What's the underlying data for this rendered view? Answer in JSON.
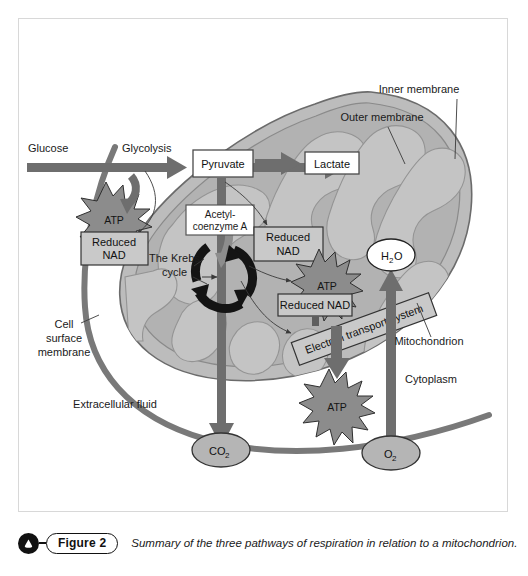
{
  "figure": {
    "number_label": "Figure 2",
    "caption": "Summary of the three pathways of respiration in relation to a mitochondrion.",
    "badge_icon": "triangle-in-circle-icon"
  },
  "diagram": {
    "title": "Summary of the three pathways of respiration in relation to a mitochondrion",
    "pathway_labels": {
      "glucose": "Glucose",
      "glycolysis": "Glycolysis",
      "pyruvate": "Pyruvate",
      "lactate": "Lactate",
      "acetyl_coenzyme_a_line1": "Acetyl-",
      "acetyl_coenzyme_a_line2": "coenzyme A",
      "krebs_line1": "The Krebs",
      "krebs_line2": "cycle",
      "electron_transport_system": "Electron transport system"
    },
    "products": {
      "atp_glycolysis": "ATP",
      "atp_krebs": "ATP",
      "atp_ets": "ATP",
      "reduced_nad_glycolysis_line1": "Reduced",
      "reduced_nad_glycolysis_line2": "NAD",
      "reduced_nad_link_line1": "Reduced",
      "reduced_nad_link_line2": "NAD",
      "reduced_nad_krebs": "Reduced NAD",
      "water": "H",
      "water_sub": "2",
      "water_tail": "O",
      "carbon_dioxide": "CO",
      "carbon_dioxide_sub": "2",
      "oxygen": "O",
      "oxygen_sub": "2"
    },
    "structure_labels": {
      "inner_membrane": "Inner membrane",
      "outer_membrane": "Outer membrane",
      "mitochondrion": "Mitochondrion",
      "cytoplasm": "Cytoplasm",
      "cell_surface_membrane_line1": "Cell",
      "cell_surface_membrane_line2": "surface",
      "cell_surface_membrane_line3": "membrane",
      "extracellular_fluid": "Extracellular fluid"
    },
    "colors": {
      "frame_border": "#d8d8d8",
      "page_background": "#ffffff",
      "arrow_gray": "#6e6e6e",
      "membrane_gray": "#7a7a7a",
      "mito_matrix_fill": "#b9b9b9",
      "mito_inner_fill": "#a8a8a8",
      "cristae_fill": "#c6c6c6",
      "star_fill": "#8c8c8c",
      "box_fill": "#c9c9c9",
      "box_white": "#ffffff",
      "ellipse_fill": "#b5b5b5",
      "krebs_ring": "#141414",
      "text": "#1a1a1a"
    }
  }
}
